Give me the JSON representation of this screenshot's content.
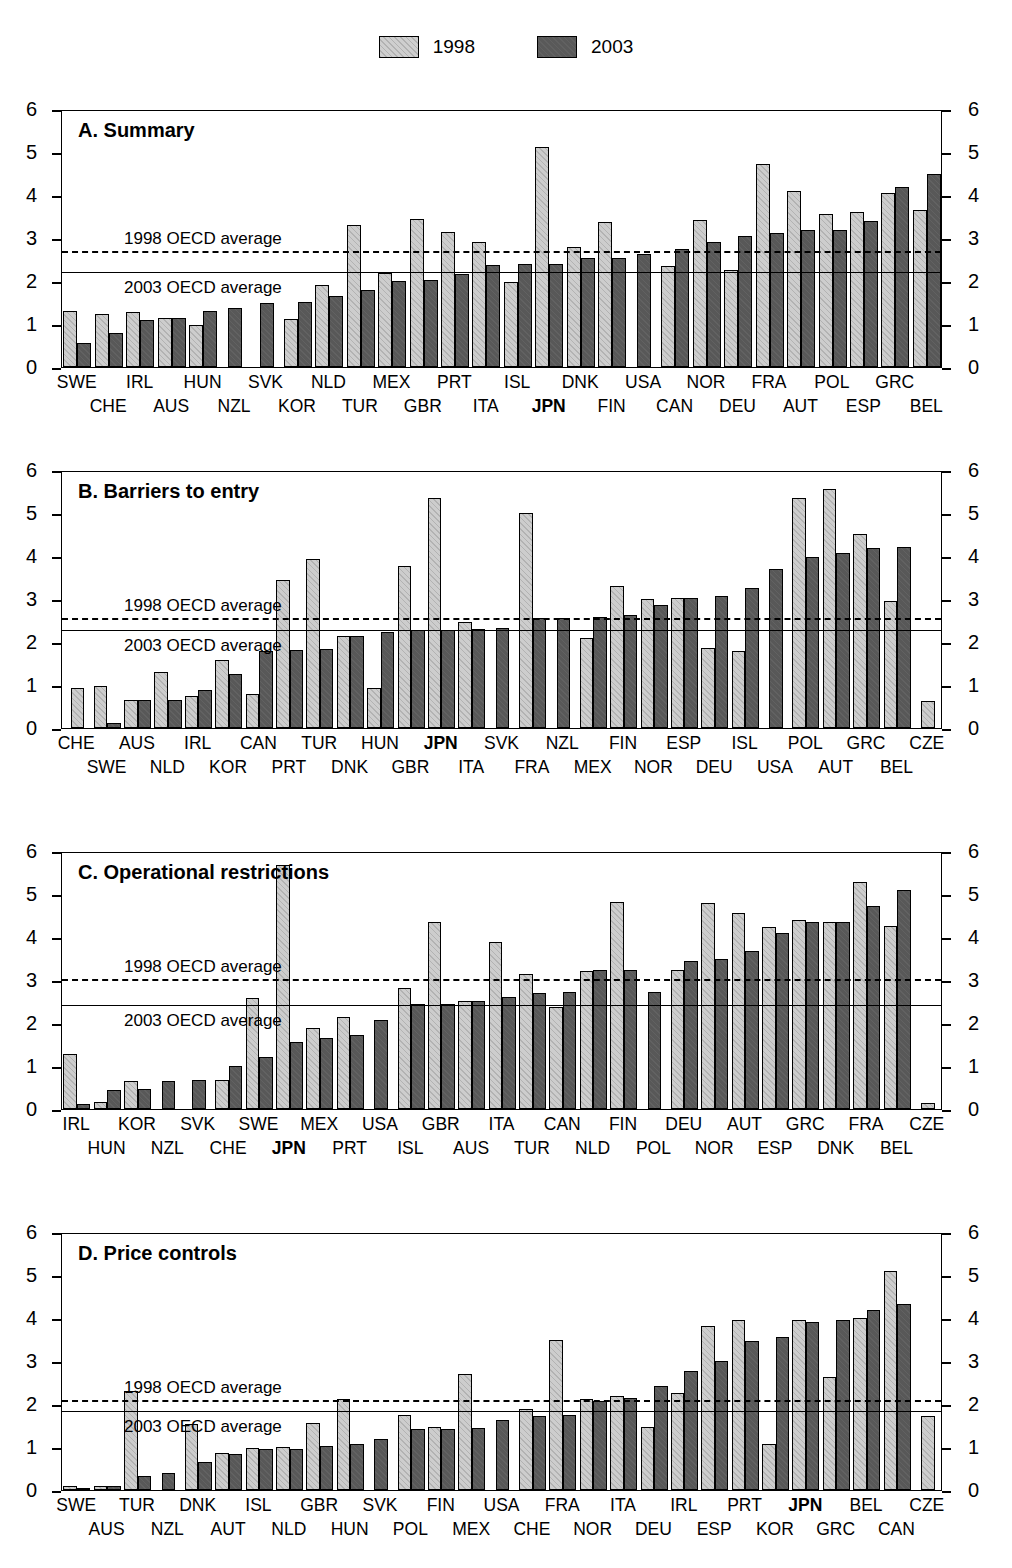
{
  "legend": {
    "items": [
      {
        "label": "1998",
        "swatch": "light-hatched-square",
        "color": "#cdcdcd"
      },
      {
        "label": "2003",
        "swatch": "dark-square",
        "color": "#585858"
      }
    ]
  },
  "axis": {
    "ticks": [
      "0",
      "1",
      "2",
      "3",
      "4",
      "5",
      "6"
    ],
    "min": 0,
    "max": 6
  },
  "avg_labels": {
    "y1998": "1998 OECD average",
    "y2003": "2003 OECD average"
  },
  "chart_data": [
    {
      "type": "bar",
      "title": "A. Summary",
      "xlabel": "",
      "ylabel": "",
      "ylim": [
        0,
        6
      ],
      "grid": false,
      "legend_position": "top-center",
      "avg_1998": 2.75,
      "avg_2003": 2.26,
      "categories": [
        "SWE",
        "CHE",
        "IRL",
        "AUS",
        "HUN",
        "NZL",
        "SVK",
        "KOR",
        "NLD",
        "TUR",
        "MEX",
        "GBR",
        "PRT",
        "ITA",
        "ISL",
        "JPN",
        "DNK",
        "FIN",
        "USA",
        "CAN",
        "NOR",
        "DEU",
        "FRA",
        "AUT",
        "POL",
        "ESP",
        "GRC",
        "BEL"
      ],
      "bold_categories": [
        "JPN"
      ],
      "series": [
        {
          "name": "1998",
          "values": [
            1.3,
            1.24,
            1.28,
            1.14,
            0.97,
            null,
            null,
            1.12,
            1.91,
            3.31,
            2.18,
            3.44,
            3.13,
            2.91,
            1.97,
            5.12,
            2.78,
            3.37,
            null,
            2.36,
            3.43,
            2.25,
            4.73,
            4.09,
            3.55,
            3.61,
            4.04,
            3.66
          ]
        },
        {
          "name": "2003",
          "values": [
            0.55,
            0.8,
            1.1,
            1.14,
            1.31,
            1.38,
            1.48,
            1.52,
            1.64,
            1.78,
            2.01,
            2.03,
            2.17,
            2.37,
            2.4,
            2.4,
            2.54,
            2.53,
            2.62,
            2.74,
            2.9,
            3.05,
            3.12,
            3.18,
            3.18,
            3.4,
            4.18,
            4.49
          ]
        }
      ]
    },
    {
      "type": "bar",
      "title": "B. Barriers to entry",
      "xlabel": "",
      "ylabel": "",
      "ylim": [
        0,
        6
      ],
      "grid": false,
      "legend_position": "top-center",
      "avg_1998": 2.6,
      "avg_2003": 2.33,
      "categories": [
        "CHE",
        "SWE",
        "AUS",
        "NLD",
        "IRL",
        "KOR",
        "CAN",
        "PRT",
        "TUR",
        "DNK",
        "HUN",
        "GBR",
        "JPN",
        "ITA",
        "SVK",
        "FRA",
        "NZL",
        "MEX",
        "FIN",
        "NOR",
        "ESP",
        "DEU",
        "ISL",
        "USA",
        "POL",
        "AUT",
        "GRC",
        "BEL",
        "CZE"
      ],
      "bold_categories": [
        "JPN"
      ],
      "series": [
        {
          "name": "1998",
          "values": [
            0.93,
            0.97,
            0.65,
            1.3,
            0.75,
            1.59,
            0.8,
            3.45,
            3.94,
            2.14,
            0.93,
            3.77,
            5.36,
            2.47,
            null,
            5.01,
            null,
            2.1,
            3.31,
            2.99,
            3.02,
            1.85,
            1.79,
            null,
            5.34,
            5.56,
            4.51,
            2.95,
            0.63
          ]
        },
        {
          "name": "2003",
          "values": [
            null,
            0.12,
            0.65,
            0.65,
            0.89,
            1.25,
            1.78,
            1.81,
            1.84,
            2.14,
            2.23,
            2.27,
            2.29,
            2.31,
            2.33,
            2.56,
            2.57,
            2.59,
            2.62,
            2.86,
            3.02,
            3.06,
            3.25,
            3.69,
            3.98,
            4.07,
            4.19,
            4.22,
            null
          ]
        }
      ]
    },
    {
      "type": "bar",
      "title": "C. Operational restrictions",
      "xlabel": "",
      "ylabel": "",
      "ylim": [
        0,
        6
      ],
      "grid": false,
      "legend_position": "top-center",
      "avg_1998": 3.08,
      "avg_2003": 2.47,
      "categories": [
        "IRL",
        "HUN",
        "KOR",
        "NZL",
        "SVK",
        "CHE",
        "SWE",
        "JPN",
        "MEX",
        "PRT",
        "USA",
        "ISL",
        "GBR",
        "AUS",
        "ITA",
        "TUR",
        "CAN",
        "NLD",
        "FIN",
        "POL",
        "DEU",
        "NOR",
        "AUT",
        "ESP",
        "GRC",
        "DNK",
        "FRA",
        "BEL",
        "CZE"
      ],
      "bold_categories": [
        "JPN"
      ],
      "series": [
        {
          "name": "1998",
          "values": [
            1.28,
            0.17,
            0.66,
            null,
            null,
            0.67,
            2.58,
            5.67,
            1.88,
            2.15,
            null,
            2.81,
            4.36,
            2.51,
            3.89,
            3.14,
            2.37,
            3.22,
            4.81,
            null,
            3.23,
            4.79,
            4.57,
            4.23,
            4.4,
            4.34,
            5.27,
            4.26,
            0.13
          ]
        },
        {
          "name": "2003",
          "values": [
            0.12,
            0.45,
            0.46,
            0.66,
            0.68,
            1.0,
            1.22,
            1.56,
            1.65,
            1.71,
            2.08,
            2.44,
            2.44,
            2.51,
            2.6,
            2.69,
            2.71,
            3.23,
            3.24,
            2.72,
            3.44,
            3.5,
            3.68,
            4.1,
            4.34,
            4.34,
            4.73,
            5.09,
            null
          ]
        }
      ]
    },
    {
      "type": "bar",
      "title": "D. Price controls",
      "xlabel": "",
      "ylabel": "",
      "ylim": [
        0,
        6
      ],
      "grid": false,
      "legend_position": "top-center",
      "avg_1998": 2.13,
      "avg_2003": 1.88,
      "categories": [
        "SWE",
        "AUS",
        "TUR",
        "NZL",
        "DNK",
        "AUT",
        "ISL",
        "NLD",
        "GBR",
        "HUN",
        "SVK",
        "POL",
        "FIN",
        "MEX",
        "USA",
        "CHE",
        "FRA",
        "NOR",
        "ITA",
        "DEU",
        "IRL",
        "ESP",
        "PRT",
        "KOR",
        "JPN",
        "GRC",
        "BEL",
        "CAN",
        "CZE"
      ],
      "bold_categories": [
        "JPN"
      ],
      "series": [
        {
          "name": "1998",
          "values": [
            0.1,
            0.1,
            2.3,
            null,
            1.54,
            0.85,
            0.97,
            0.99,
            1.55,
            2.12,
            null,
            1.74,
            1.47,
            2.69,
            null,
            1.88,
            3.48,
            2.12,
            2.18,
            1.46,
            2.25,
            3.82,
            3.95,
            1.08,
            3.96,
            2.62,
            3.99,
            5.1,
            1.73
          ]
        },
        {
          "name": "2003",
          "values": [
            0.05,
            0.09,
            0.33,
            0.4,
            0.66,
            0.84,
            0.95,
            0.95,
            1.02,
            1.08,
            1.19,
            1.41,
            1.41,
            1.45,
            1.62,
            1.72,
            1.75,
            2.07,
            2.15,
            2.41,
            2.76,
            3.0,
            3.46,
            3.55,
            3.91,
            3.95,
            4.18,
            4.33,
            null
          ]
        }
      ]
    }
  ]
}
